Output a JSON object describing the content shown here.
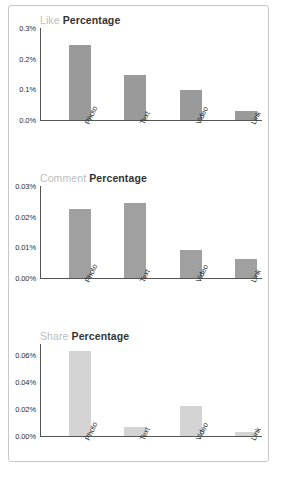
{
  "chart_data": [
    {
      "type": "bar",
      "title": "Like Percentage",
      "title_word_1": "Like",
      "title_word_2": "Percentage",
      "categories": [
        "Photo",
        "Text",
        "Video",
        "Link"
      ],
      "values": [
        0.245,
        0.148,
        0.097,
        0.03
      ],
      "value_labels": [
        "0.245%",
        "0.148%",
        "0.097%",
        "0.030%"
      ],
      "ticks": [
        "0.0%",
        "0.1%",
        "0.2%",
        "0.3%"
      ],
      "tick_values": [
        0.0,
        0.1,
        0.2,
        0.3
      ],
      "ylim": [
        0,
        0.3
      ],
      "xlabel": "",
      "ylabel": "",
      "grid": false,
      "legend": "none",
      "bar_color": "#9a9a9a"
    },
    {
      "type": "bar",
      "title": "Comment Percentage",
      "title_word_1": "Comment",
      "title_word_2": "Percentage",
      "categories": [
        "Photo",
        "Text",
        "Video",
        "Link"
      ],
      "values": [
        0.0225,
        0.0243,
        0.0092,
        0.0063
      ],
      "value_labels": [
        "0.0225%",
        "0.0243%",
        "0.0092%",
        "0.0063%"
      ],
      "ticks": [
        "0.00%",
        "0.01%",
        "0.02%",
        "0.03%"
      ],
      "tick_values": [
        0.0,
        0.01,
        0.02,
        0.03
      ],
      "ylim": [
        0,
        0.03
      ],
      "xlabel": "",
      "ylabel": "",
      "grid": false,
      "legend": "none",
      "bar_color": "#a0a0a0"
    },
    {
      "type": "bar",
      "title": "Share Percentage",
      "title_word_1": "Share",
      "title_word_2": "Percentage",
      "categories": [
        "Photo",
        "Text",
        "Video",
        "Link"
      ],
      "values": [
        0.0625,
        0.0067,
        0.0225,
        0.003
      ],
      "value_labels": [
        "0.0625%",
        "0.0067%",
        "0.0225%",
        "0.0030%"
      ],
      "ticks": [
        "0.00%",
        "0.02%",
        "0.04%",
        "0.06%"
      ],
      "tick_values": [
        0.0,
        0.02,
        0.04,
        0.06
      ],
      "ylim": [
        0,
        0.068
      ],
      "xlabel": "",
      "ylabel": "",
      "grid": false,
      "legend": "none",
      "bar_color": "#d4d4d4"
    }
  ],
  "colors": {
    "axis": "#555555",
    "title_muted": "#bdbdbd",
    "title_strong": "#333333",
    "tick_text": "#2b2b2b",
    "card_border": "#c8c8c8",
    "background": "#ffffff"
  }
}
